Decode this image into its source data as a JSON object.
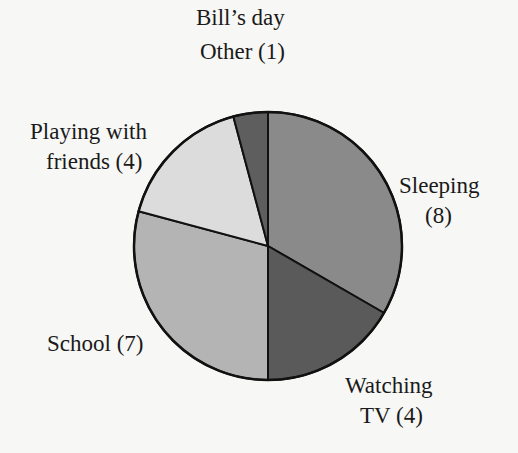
{
  "chart_data": {
    "type": "pie",
    "categories": [
      "Sleeping",
      "Watching TV",
      "School",
      "Playing with friends",
      "Other"
    ],
    "values": [
      8,
      4,
      7,
      4,
      1
    ],
    "labels": [
      "Sleeping (8)",
      "Watching TV (4)",
      "School (7)",
      "Playing with friends (4)",
      "Other (1)"
    ],
    "colors": [
      "#8a8a8a",
      "#5a5a5a",
      "#b4b4b4",
      "#dcdcdc",
      "#5e5e5e"
    ],
    "start_angle_deg": 0,
    "direction": "clockwise",
    "total": 24,
    "legend": "none"
  },
  "labels": {
    "title": "Bill’s day",
    "other": "Other (1)",
    "playing_line1": "Playing with",
    "playing_line2": "friends (4)",
    "sleeping_line1": "Sleeping",
    "sleeping_line2": "(8)",
    "school": "School (7)",
    "tv_line1": "Watching",
    "tv_line2": "TV (4)"
  }
}
